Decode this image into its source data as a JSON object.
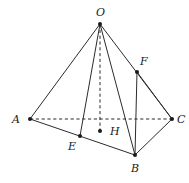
{
  "figure": {
    "type": "geometry-diagram",
    "canvas": {
      "width": 189,
      "height": 183
    },
    "colors": {
      "background": "#ffffff",
      "stroke": "#2b2b2b",
      "vertex": "#1a1a1a",
      "label": "#1a1a1a"
    },
    "points": [
      {
        "id": "O",
        "label": "O",
        "x": 100,
        "y": 24,
        "label_x": 96,
        "label_y": 7,
        "dot": true
      },
      {
        "id": "A",
        "label": "A",
        "x": 30,
        "y": 119,
        "label_x": 12,
        "label_y": 114,
        "dot": true
      },
      {
        "id": "C",
        "label": "C",
        "x": 172,
        "y": 119,
        "label_x": 177,
        "label_y": 114,
        "dot": true
      },
      {
        "id": "B",
        "label": "B",
        "x": 135,
        "y": 155,
        "label_x": 131,
        "label_y": 163,
        "dot": true
      },
      {
        "id": "E",
        "label": "E",
        "x": 80,
        "y": 136,
        "label_x": 68,
        "label_y": 141,
        "dot": true
      },
      {
        "id": "F",
        "label": "F",
        "x": 137,
        "y": 72,
        "label_x": 140,
        "label_y": 56,
        "dot": true
      },
      {
        "id": "H",
        "label": "H",
        "x": 100,
        "y": 131,
        "label_x": 110,
        "label_y": 126,
        "dot": true
      }
    ],
    "edges_solid": [
      {
        "id": "OA",
        "from": "O",
        "to": "A"
      },
      {
        "id": "OE",
        "from": "O",
        "to": "E"
      },
      {
        "id": "OB",
        "from": "O",
        "to": "B"
      },
      {
        "id": "OC",
        "from": "O",
        "to": "C"
      },
      {
        "id": "AB",
        "from": "A",
        "to": "B"
      },
      {
        "id": "BC",
        "from": "B",
        "to": "C"
      },
      {
        "id": "FB",
        "from": "F",
        "to": "B"
      },
      {
        "id": "FC",
        "from": "F",
        "to": "C"
      }
    ],
    "edges_dashed": [
      {
        "id": "AC",
        "from": "A",
        "to": "C"
      },
      {
        "id": "OH",
        "from": "O",
        "to": "H"
      }
    ]
  }
}
